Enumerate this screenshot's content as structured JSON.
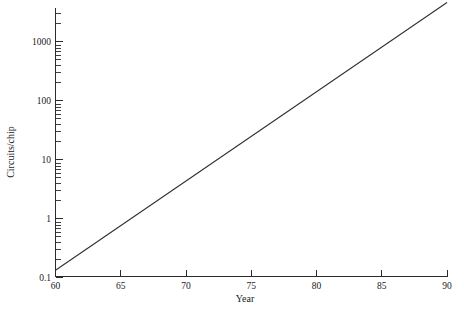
{
  "chart_data": {
    "type": "line",
    "title": "",
    "subtitle": "",
    "xlabel": "Year",
    "ylabel": "Circuits/chip",
    "xscale": "linear",
    "yscale": "log",
    "xlim": [
      60,
      90
    ],
    "ylim": [
      0.1,
      5000
    ],
    "grid": false,
    "legend": false,
    "legend_position": "none",
    "x_major_ticks": [
      60,
      65,
      70,
      75,
      80,
      85,
      90
    ],
    "x_tick_labels": [
      "60",
      "65",
      "70",
      "75",
      "80",
      "85",
      "90"
    ],
    "y_major_ticks": [
      0.1,
      1,
      10,
      100,
      1000
    ],
    "y_tick_labels": [
      "0.1",
      "1",
      "10",
      "100",
      "1000"
    ],
    "y_minor_ticks": [
      0.2,
      0.3,
      0.4,
      0.5,
      0.6,
      0.7,
      0.8,
      0.9,
      2,
      3,
      4,
      5,
      6,
      7,
      8,
      9,
      20,
      30,
      40,
      50,
      60,
      70,
      80,
      90,
      200,
      300,
      400,
      500,
      600,
      700,
      800,
      900,
      2000,
      3000,
      4000,
      5000
    ],
    "series": [
      {
        "name": "Circuits/chip",
        "color": "#2e2e2e",
        "x": [
          60,
          62,
          64,
          66,
          68,
          70,
          72,
          74,
          76,
          78,
          80,
          82,
          84,
          86,
          88,
          90
        ],
        "values": [
          0.13,
          0.29,
          0.65,
          1.45,
          3.2,
          7.2,
          16,
          36,
          80,
          180,
          400,
          890,
          1990,
          4450,
          9900,
          4500
        ],
        "x_endpoints": [
          60,
          90
        ],
        "y_endpoints": [
          0.13,
          4500
        ],
        "annotation": ""
      }
    ],
    "annotations": []
  },
  "axes": {
    "x_title": "Year",
    "y_title": "Circuits/chip"
  }
}
